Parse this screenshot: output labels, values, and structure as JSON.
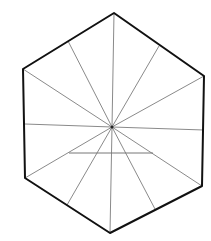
{
  "diagram": {
    "shape": "hexagon",
    "colors": {
      "outline": "#111111",
      "spokes": "#8a8a8a",
      "chord": "#777777",
      "background": "#ffffff"
    },
    "center": [
      112,
      127
    ],
    "vertices": [
      [
        114,
        13
      ],
      [
        204,
        76
      ],
      [
        202,
        186
      ],
      [
        110,
        233
      ],
      [
        25,
        178
      ],
      [
        23,
        69
      ]
    ],
    "spoke_endpoints": [
      [
        114,
        13
      ],
      [
        159,
        46
      ],
      [
        204,
        76
      ],
      [
        204,
        130
      ],
      [
        202,
        186
      ],
      [
        155,
        209
      ],
      [
        110,
        233
      ],
      [
        67,
        205
      ],
      [
        25,
        178
      ],
      [
        25,
        124
      ],
      [
        23,
        69
      ],
      [
        68,
        41
      ]
    ],
    "chord": {
      "from": [
        69,
        153
      ],
      "to": [
        153,
        153
      ]
    }
  }
}
